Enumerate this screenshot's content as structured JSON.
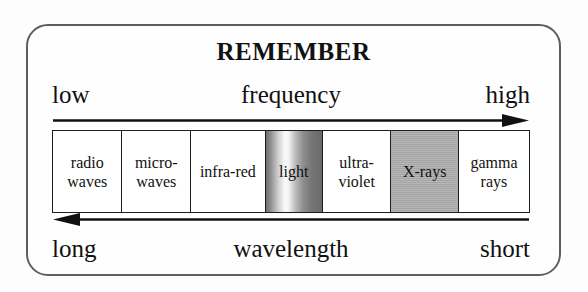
{
  "diagram": {
    "title": "REMEMBER",
    "frame": {
      "border_color": "#5b5f63",
      "background": "#fefefe"
    },
    "frequency_axis": {
      "name": "frequency",
      "low_label": "low",
      "high_label": "high",
      "center_label": "frequency",
      "arrow_direction": "right",
      "arrow_icon": "arrow-right-icon"
    },
    "wavelength_axis": {
      "name": "wavelength",
      "long_label": "long",
      "short_label": "short",
      "center_label": "wavelength",
      "arrow_direction": "left",
      "arrow_icon": "arrow-left-icon"
    },
    "spectrum": {
      "border_color": "#1d1d1d",
      "bands": [
        {
          "id": "radio-waves",
          "label": "radio\nwaves",
          "fill": "white",
          "width_pct": 14.6
        },
        {
          "id": "micro-waves",
          "label": "micro-\nwaves",
          "fill": "white",
          "width_pct": 14.4
        },
        {
          "id": "infra-red",
          "label": "infra-red",
          "fill": "white",
          "width_pct": 15.7
        },
        {
          "id": "light",
          "label": "light",
          "fill": "gradient",
          "width_pct": 12.0
        },
        {
          "id": "ultra-violet",
          "label": "ultra-\nviolet",
          "fill": "white",
          "width_pct": 14.4
        },
        {
          "id": "x-rays",
          "label": "X-rays",
          "fill": "gray",
          "width_pct": 14.2
        },
        {
          "id": "gamma-rays",
          "label": "gamma\nrays",
          "fill": "white",
          "width_pct": 14.7
        }
      ]
    },
    "colors": {
      "gray_fill": "#a9a9a9",
      "gradient_bright": "#fbfbfb",
      "gradient_dark": "#6f6f6f",
      "ink": "#111111"
    }
  }
}
